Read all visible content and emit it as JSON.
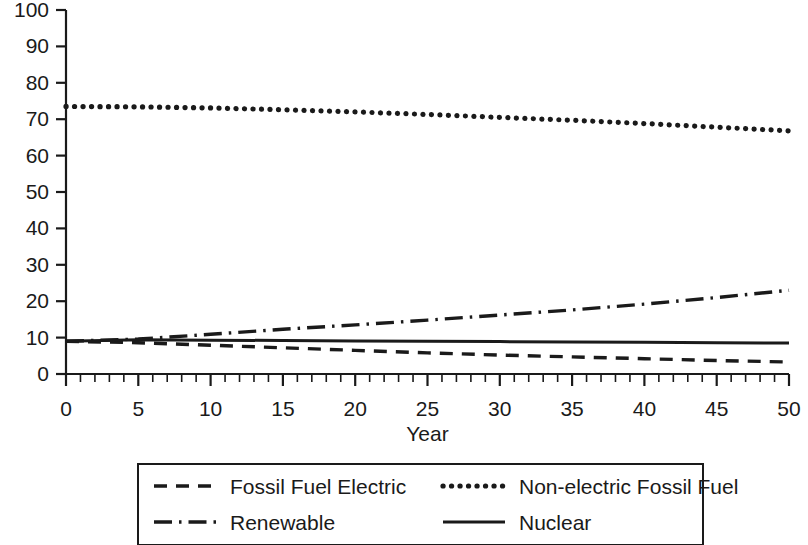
{
  "chart_data": {
    "type": "line",
    "title": "",
    "xlabel": "Year",
    "ylabel": "",
    "xlim": [
      0,
      50
    ],
    "ylim": [
      0,
      100
    ],
    "grid": false,
    "legend_position": "bottom",
    "x_ticks": [
      0,
      5,
      10,
      15,
      20,
      25,
      30,
      35,
      40,
      45,
      50
    ],
    "x_tick_labels": [
      "0",
      "5",
      "10",
      "15",
      "20",
      "25",
      "30",
      "35",
      "40",
      "45",
      "50"
    ],
    "x_minor_tick_step": 1,
    "y_ticks": [
      0,
      10,
      20,
      30,
      40,
      50,
      60,
      70,
      80,
      90,
      100
    ],
    "y_tick_labels": [
      "0",
      "10",
      "20",
      "30",
      "40",
      "50",
      "60",
      "70",
      "80",
      "90",
      "100"
    ],
    "x": [
      0,
      5,
      10,
      15,
      20,
      25,
      30,
      35,
      40,
      45,
      50
    ],
    "series": [
      {
        "name": "Fossil Fuel Electric",
        "dash": "dashed",
        "color": "#1a1a1a",
        "values": [
          9.0,
          8.6,
          7.9,
          7.2,
          6.5,
          5.8,
          5.2,
          4.7,
          4.2,
          3.7,
          3.3
        ]
      },
      {
        "name": "Non-electric Fossil Fuel",
        "dash": "dotted",
        "color": "#1a1a1a",
        "values": [
          73.5,
          73.4,
          73.1,
          72.6,
          72.0,
          71.3,
          70.5,
          69.7,
          68.8,
          67.8,
          66.8
        ]
      },
      {
        "name": "Renewable",
        "dash": "dashdot",
        "color": "#1a1a1a",
        "values": [
          9.0,
          9.6,
          10.9,
          12.3,
          13.5,
          14.8,
          16.2,
          17.6,
          19.2,
          21.0,
          23.0
        ]
      },
      {
        "name": "Nuclear",
        "dash": "solid",
        "color": "#1a1a1a",
        "values": [
          9.0,
          9.4,
          9.3,
          9.2,
          9.1,
          9.0,
          8.9,
          8.8,
          8.7,
          8.6,
          8.5
        ]
      }
    ]
  },
  "legend": {
    "entries": [
      {
        "label": "Fossil Fuel Electric",
        "dash": "dashed"
      },
      {
        "label": "Non-electric Fossil Fuel",
        "dash": "dotted"
      },
      {
        "label": "Renewable",
        "dash": "dashdot"
      },
      {
        "label": "Nuclear",
        "dash": "solid"
      }
    ]
  },
  "axes": {
    "x_title": "Year"
  }
}
